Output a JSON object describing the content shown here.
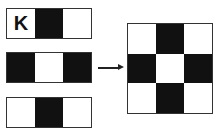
{
  "strips": [
    {
      "label": "K",
      "cells": [
        "white",
        "black",
        "white"
      ]
    },
    {
      "label": "",
      "cells": [
        "black",
        "white",
        "black"
      ]
    },
    {
      "label": "",
      "cells": [
        "white",
        "black",
        "white"
      ]
    }
  ],
  "arrow": {
    "direction": "right"
  },
  "result_grid": {
    "rows": [
      [
        "white",
        "black",
        "white"
      ],
      [
        "black",
        "white",
        "black"
      ],
      [
        "white",
        "black",
        "white"
      ]
    ]
  },
  "colors": {
    "black": "#111111",
    "white": "#ffffff",
    "border": "#333333"
  }
}
